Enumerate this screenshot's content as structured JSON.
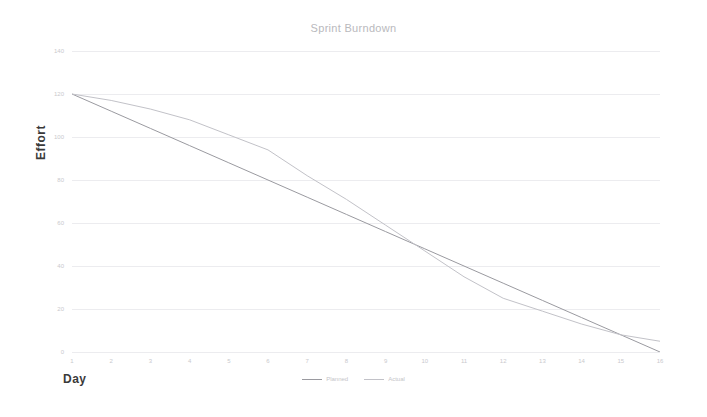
{
  "chart_data": {
    "type": "line",
    "title": "Sprint Burndown",
    "xlabel": "Day",
    "ylabel": "Effort",
    "x": [
      1,
      2,
      3,
      4,
      5,
      6,
      7,
      8,
      9,
      10,
      11,
      12,
      13,
      14,
      15,
      16
    ],
    "xlim": [
      1,
      16
    ],
    "ylim": [
      0,
      140
    ],
    "xticks": [
      "1",
      "2",
      "3",
      "4",
      "5",
      "6",
      "7",
      "8",
      "9",
      "10",
      "11",
      "12",
      "13",
      "14",
      "15",
      "16"
    ],
    "yticks": [
      "0",
      "20",
      "40",
      "60",
      "80",
      "100",
      "120",
      "140"
    ],
    "grid": true,
    "legend_position": "bottom",
    "series": [
      {
        "name": "Planned",
        "color": "#9a9aa0",
        "values": [
          120,
          112,
          104,
          96,
          88,
          80,
          72,
          64,
          56,
          48,
          40,
          32,
          24,
          16,
          8,
          0
        ]
      },
      {
        "name": "Actual",
        "color": "#c2c2c8",
        "values": [
          120,
          117,
          113,
          108,
          101,
          94,
          82,
          71,
          59,
          47,
          35,
          25,
          19,
          13,
          8,
          5
        ]
      }
    ]
  },
  "axes": {
    "y_title": "Effort",
    "x_title": "Day"
  },
  "colors": {
    "grid": "#ececef",
    "tick_text": "#c9c9cd",
    "title_text": "#b9b9bd",
    "axis_title_text": "#3a3a3a",
    "background": "#ffffff"
  }
}
